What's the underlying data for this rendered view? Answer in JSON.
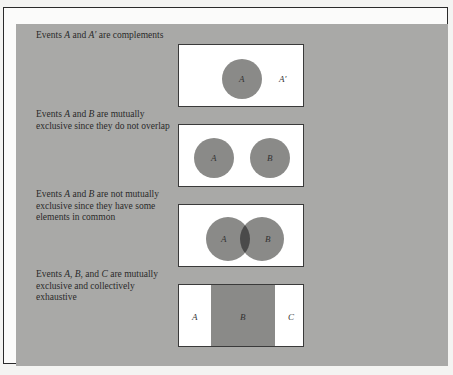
{
  "colors": {
    "page_bg": "#f4f4f2",
    "panel_bg": "#a9a9a7",
    "box_bg": "#ffffff",
    "event_fill": "#8a8a88",
    "overlap_fill": "#4a4a4a",
    "border": "#2b2b2b"
  },
  "rows": [
    {
      "caption_parts": [
        "Events ",
        "A",
        " and ",
        "A′",
        " are complements"
      ],
      "diagram": {
        "type": "complement",
        "labels": [
          "A",
          "A′"
        ]
      }
    },
    {
      "caption_parts": [
        "Events ",
        "A",
        " and ",
        "B",
        " are mutually exclusive since they do not overlap"
      ],
      "diagram": {
        "type": "disjoint",
        "labels": [
          "A",
          "B"
        ]
      }
    },
    {
      "caption_parts": [
        "Events ",
        "A",
        " and ",
        "B",
        " are not mutually exclusive since they have some elements in common"
      ],
      "diagram": {
        "type": "overlapping",
        "labels": [
          "A",
          "B"
        ]
      }
    },
    {
      "caption_parts": [
        "Events ",
        "A",
        ", ",
        "B",
        ", and ",
        "C",
        " are mutually exclusive and collectively exhaustive"
      ],
      "diagram": {
        "type": "partition",
        "labels": [
          "A",
          "B",
          "C"
        ]
      }
    }
  ]
}
